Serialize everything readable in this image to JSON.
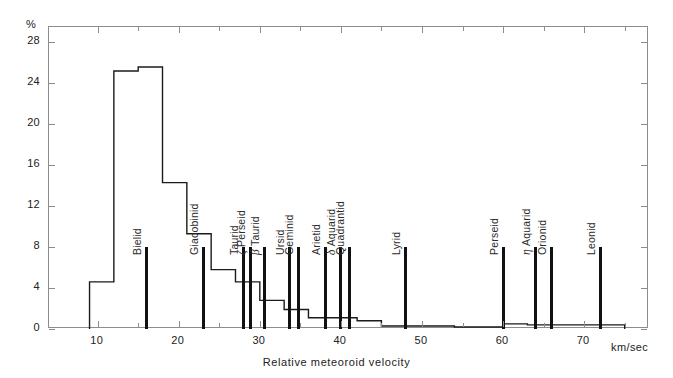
{
  "chart_data": {
    "type": "bar",
    "title": "",
    "subtitle": "",
    "xlabel": "Relative meteoroid velocity",
    "xunit": "km/sec",
    "ylabel": "",
    "yunit": "%",
    "xlim": [
      4,
      78
    ],
    "ylim": [
      0,
      29.5
    ],
    "grid": false,
    "legend": null,
    "xticks": [
      10,
      20,
      30,
      40,
      50,
      60,
      70
    ],
    "xticks_minor": [
      15,
      25,
      35,
      45,
      55,
      65,
      75
    ],
    "yticks": [
      0,
      4,
      8,
      12,
      16,
      20,
      24,
      28
    ],
    "xtick_labels": [
      "10",
      "20",
      "30",
      "40",
      "50",
      "60",
      "70"
    ],
    "ytick_labels": [
      "0",
      "4",
      "8",
      "12",
      "16",
      "20",
      "24",
      "28"
    ],
    "bins": [
      {
        "x0": 9,
        "x1": 12,
        "value": 4.6
      },
      {
        "x0": 12,
        "x1": 15,
        "value": 25.2
      },
      {
        "x0": 15,
        "x1": 18,
        "value": 25.6
      },
      {
        "x0": 18,
        "x1": 21,
        "value": 14.3
      },
      {
        "x0": 21,
        "x1": 24,
        "value": 9.3
      },
      {
        "x0": 24,
        "x1": 27,
        "value": 5.8
      },
      {
        "x0": 27,
        "x1": 30,
        "value": 4.6
      },
      {
        "x0": 30,
        "x1": 33,
        "value": 2.8
      },
      {
        "x0": 33,
        "x1": 36,
        "value": 1.9
      },
      {
        "x0": 36,
        "x1": 39,
        "value": 1.1
      },
      {
        "x0": 39,
        "x1": 42,
        "value": 1.1
      },
      {
        "x0": 42,
        "x1": 45,
        "value": 0.8
      },
      {
        "x0": 45,
        "x1": 48,
        "value": 0.3
      },
      {
        "x0": 48,
        "x1": 54,
        "value": 0.3
      },
      {
        "x0": 54,
        "x1": 57,
        "value": 0.2
      },
      {
        "x0": 57,
        "x1": 60,
        "value": 0.2
      },
      {
        "x0": 60,
        "x1": 63,
        "value": 0.5
      },
      {
        "x0": 63,
        "x1": 66,
        "value": 0.4
      },
      {
        "x0": 66,
        "x1": 75,
        "value": 0.4
      }
    ],
    "showers": [
      {
        "name": "Bielid",
        "label": "Bielid",
        "velocity": 16.0,
        "marker_top": 8.0
      },
      {
        "name": "Giacobinid",
        "label": "Giacobinid",
        "velocity": 23.0,
        "marker_top": 8.0
      },
      {
        "name": "Taurid",
        "label": "Taurid",
        "velocity": 28.0,
        "marker_top": 8.0
      },
      {
        "name": "zeta Perseid",
        "label": "Perseid",
        "greek": "ζ",
        "velocity": 28.8,
        "marker_top": 8.0
      },
      {
        "name": "beta Taurid",
        "label": "Taurid",
        "greek": "β",
        "velocity": 30.6,
        "marker_top": 8.0
      },
      {
        "name": "Ursid",
        "label": "Ursid",
        "velocity": 33.6,
        "marker_top": 8.0
      },
      {
        "name": "Geminid",
        "label": "Geminid",
        "velocity": 34.8,
        "marker_top": 8.0
      },
      {
        "name": "Arietid",
        "label": "Arietid",
        "velocity": 38.1,
        "marker_top": 8.0
      },
      {
        "name": "delta Aquarid",
        "label": "Aquarid",
        "greek": "δ",
        "velocity": 40.0,
        "marker_top": 8.0
      },
      {
        "name": "Quadrantid",
        "label": "Quadrantid",
        "velocity": 41.0,
        "marker_top": 8.0
      },
      {
        "name": "Lyrid",
        "label": "Lyrid",
        "velocity": 48.0,
        "marker_top": 8.0
      },
      {
        "name": "Perseid",
        "label": "Perseid",
        "velocity": 60.0,
        "marker_top": 8.0
      },
      {
        "name": "eta Aquarid",
        "label": "Aquarid",
        "greek": "η",
        "velocity": 64.0,
        "marker_top": 8.0
      },
      {
        "name": "Orionid",
        "label": "Orionid",
        "velocity": 66.0,
        "marker_top": 8.0
      },
      {
        "name": "Leonid",
        "label": "Leonid",
        "velocity": 72.0,
        "marker_top": 8.0
      }
    ]
  }
}
